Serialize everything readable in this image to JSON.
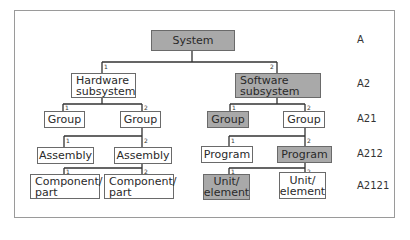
{
  "diagram": {
    "type": "hierarchy-tree",
    "highlight_color": "#a9a9a9",
    "nodes": {
      "system": {
        "label": "System",
        "highlighted": true
      },
      "hardware": {
        "line1": "Hardware",
        "line2": "subsystem",
        "branch": "1",
        "highlighted": false
      },
      "software": {
        "line1": "Software",
        "line2": "subsystem",
        "branch": "2",
        "highlighted": true
      },
      "hw_group1": {
        "label": "Group",
        "branch": "1",
        "highlighted": false
      },
      "hw_group2": {
        "label": "Group",
        "branch": "2",
        "highlighted": false
      },
      "sw_group1": {
        "label": "Group",
        "branch": "1",
        "highlighted": true
      },
      "sw_group2": {
        "label": "Group",
        "branch": "2",
        "highlighted": false
      },
      "assembly1": {
        "label": "Assembly",
        "branch": "1",
        "highlighted": false
      },
      "assembly2": {
        "label": "Assembly",
        "branch": "2",
        "highlighted": false
      },
      "program1": {
        "label": "Program",
        "branch": "1",
        "highlighted": false
      },
      "program2": {
        "label": "Program",
        "branch": "2",
        "highlighted": true
      },
      "component1": {
        "line1": "Component/",
        "line2": "part",
        "branch": "1",
        "highlighted": false
      },
      "component2": {
        "line1": "Component/",
        "line2": "part",
        "branch": "2",
        "highlighted": false
      },
      "unit1": {
        "line1": "Unit/",
        "line2": "element",
        "branch": "1",
        "highlighted": true
      },
      "unit2": {
        "line1": "Unit/",
        "line2": "element",
        "branch": "2",
        "highlighted": false
      }
    },
    "level_codes": [
      "A",
      "A2",
      "A21",
      "A212",
      "A2121"
    ]
  }
}
